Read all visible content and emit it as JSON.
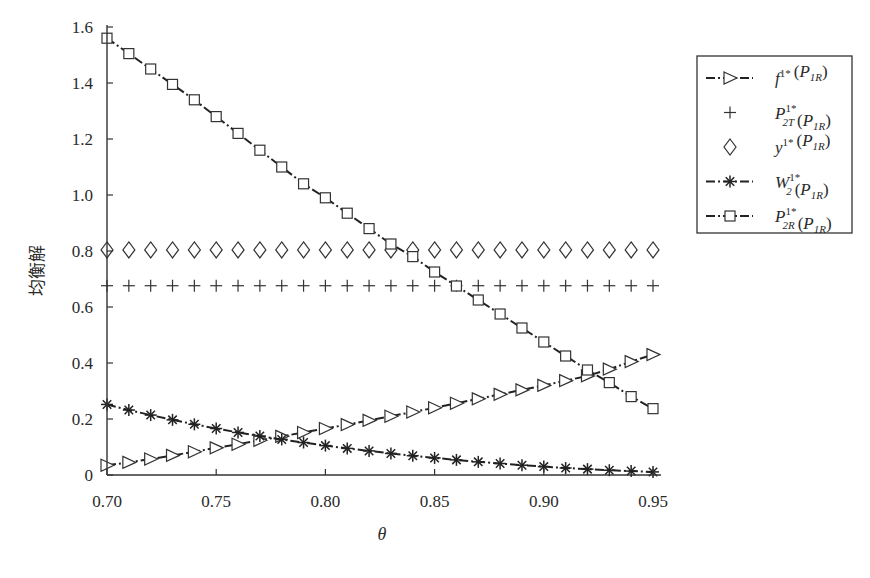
{
  "chart_data": {
    "type": "line",
    "title": "",
    "xlabel": "θ",
    "ylabel": "均衡解",
    "xlim": [
      0.7,
      0.95
    ],
    "ylim": [
      0,
      1.6
    ],
    "xticks": [
      "0.70",
      "0.75",
      "0.80",
      "0.85",
      "0.90",
      "0.95"
    ],
    "yticks": [
      "0",
      "0.2",
      "0.4",
      "0.6",
      "0.8",
      "1.0",
      "1.2",
      "1.4",
      "1.6"
    ],
    "grid": false,
    "legend_position": "upper right, outside plot area",
    "x": [
      0.7,
      0.71,
      0.72,
      0.73,
      0.74,
      0.75,
      0.76,
      0.77,
      0.78,
      0.79,
      0.8,
      0.81,
      0.82,
      0.83,
      0.84,
      0.85,
      0.86,
      0.87,
      0.88,
      0.89,
      0.9,
      0.91,
      0.92,
      0.93,
      0.94,
      0.95
    ],
    "series": [
      {
        "name": "f^{1*}(P_{1R})",
        "marker": "triangle-right",
        "line": "dash-dot",
        "values": [
          0.035,
          0.045,
          0.057,
          0.07,
          0.083,
          0.097,
          0.11,
          0.124,
          0.138,
          0.152,
          0.166,
          0.18,
          0.195,
          0.21,
          0.225,
          0.24,
          0.256,
          0.272,
          0.288,
          0.304,
          0.32,
          0.337,
          0.354,
          0.378,
          0.405,
          0.43
        ]
      },
      {
        "name": "P_{2T}^{1*}(P_{1R})",
        "marker": "plus",
        "line": "none",
        "values": [
          0.676,
          0.676,
          0.676,
          0.676,
          0.676,
          0.676,
          0.676,
          0.676,
          0.676,
          0.676,
          0.676,
          0.676,
          0.676,
          0.676,
          0.676,
          0.676,
          0.676,
          0.676,
          0.676,
          0.676,
          0.676,
          0.676,
          0.676,
          0.676,
          0.676,
          0.676
        ]
      },
      {
        "name": "y^{1*}(P_{1R})",
        "marker": "diamond",
        "line": "none",
        "values": [
          0.804,
          0.804,
          0.804,
          0.804,
          0.804,
          0.804,
          0.804,
          0.804,
          0.804,
          0.804,
          0.804,
          0.804,
          0.804,
          0.804,
          0.804,
          0.804,
          0.804,
          0.804,
          0.804,
          0.804,
          0.804,
          0.804,
          0.804,
          0.804,
          0.804,
          0.804
        ]
      },
      {
        "name": "W_2^{1*}(P_{1R})",
        "marker": "asterisk",
        "line": "dash-dot",
        "values": [
          0.252,
          0.232,
          0.214,
          0.197,
          0.181,
          0.166,
          0.152,
          0.139,
          0.127,
          0.116,
          0.105,
          0.095,
          0.086,
          0.077,
          0.069,
          0.061,
          0.054,
          0.047,
          0.041,
          0.035,
          0.03,
          0.025,
          0.021,
          0.017,
          0.014,
          0.011
        ]
      },
      {
        "name": "P_{2R}^{1*}(P_{1R})",
        "marker": "square",
        "line": "dash-dot",
        "values": [
          1.56,
          1.505,
          1.45,
          1.395,
          1.34,
          1.28,
          1.22,
          1.16,
          1.1,
          1.04,
          0.99,
          0.935,
          0.88,
          0.825,
          0.78,
          0.725,
          0.675,
          0.625,
          0.575,
          0.525,
          0.475,
          0.425,
          0.375,
          0.33,
          0.28,
          0.237
        ]
      }
    ]
  },
  "legend": {
    "items": [
      {
        "base": "f",
        "sup": "1*",
        "sub": "",
        "arg_base": "P",
        "arg_sub": "1R"
      },
      {
        "base": "P",
        "sup": "1*",
        "sub": "2T",
        "arg_base": "P",
        "arg_sub": "1R"
      },
      {
        "base": "y",
        "sup": "1*",
        "sub": "",
        "arg_base": "P",
        "arg_sub": "1R"
      },
      {
        "base": "W",
        "sup": "1*",
        "sub": "2",
        "arg_base": "P",
        "arg_sub": "1R"
      },
      {
        "base": "P",
        "sup": "1*",
        "sub": "2R",
        "arg_base": "P",
        "arg_sub": "1R"
      }
    ]
  },
  "axes": {
    "ylabel": "均衡解",
    "xlabel": "θ"
  }
}
